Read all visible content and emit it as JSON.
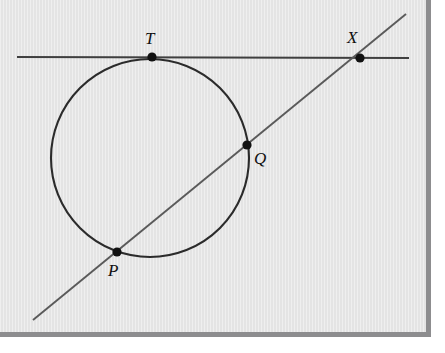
{
  "figure": {
    "name": "circle-tangent-secant-diagram",
    "background_color": "#e4e4e4",
    "frame_color": "#8d8d8f",
    "ink_color": "#3a3a3a",
    "stroke_color_circle": "#2b2b2b",
    "point_color": "#111111",
    "labels": {
      "tangent_point": "T",
      "external_point": "X",
      "secant_far_point": "Q",
      "secant_near_point": "P"
    },
    "elements": {
      "circle_name": "circle",
      "tangent_line_name": "tangent-line-TX",
      "secant_line_name": "secant-line-PQX"
    }
  },
  "chart_data": {
    "type": "scatter",
    "title": "",
    "xlabel": "",
    "ylabel": "",
    "grid": false,
    "legend": "none",
    "xlim": [
      0,
      431
    ],
    "ylim": [
      0,
      337
    ],
    "geometry": {
      "circle": {
        "cx": 150,
        "cy": 158,
        "r": 99
      },
      "tangent_line": {
        "x1": 17,
        "y1": 57,
        "x2": 409,
        "y2": 58
      },
      "secant_line": {
        "x1": 33,
        "y1": 320,
        "x2": 406,
        "y2": 14
      },
      "points": [
        {
          "label": "T",
          "x": 152,
          "y": 57,
          "label_x": 145,
          "label_y": 30
        },
        {
          "label": "X",
          "x": 360,
          "y": 58,
          "label_x": 347,
          "label_y": 29
        },
        {
          "label": "Q",
          "x": 247,
          "y": 145,
          "label_x": 254,
          "label_y": 150
        },
        {
          "label": "P",
          "x": 117,
          "y": 252,
          "label_x": 108,
          "label_y": 262
        }
      ]
    },
    "categories": [
      "T",
      "X",
      "Q",
      "P"
    ],
    "x": [
      152,
      360,
      247,
      117
    ],
    "values": [
      57,
      58,
      145,
      252
    ]
  }
}
